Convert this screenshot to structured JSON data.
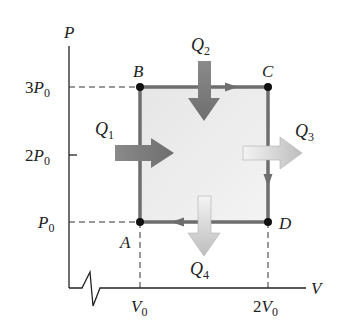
{
  "diagram": {
    "type": "PV-diagram",
    "axes": {
      "y_label": "P",
      "x_label": "V",
      "y_ticks": [
        {
          "coef": "3",
          "sym": "P",
          "sub": "0"
        },
        {
          "coef": "2",
          "sym": "P",
          "sub": "0"
        },
        {
          "coef": "",
          "sym": "P",
          "sub": "0"
        }
      ],
      "x_ticks": [
        {
          "coef": "",
          "sym": "V",
          "sub": "0"
        },
        {
          "coef": "2",
          "sym": "V",
          "sub": "0"
        }
      ]
    },
    "points": [
      {
        "name": "A",
        "V": "V0",
        "P": "P0"
      },
      {
        "name": "B",
        "V": "V0",
        "P": "3P0"
      },
      {
        "name": "C",
        "V": "2V0",
        "P": "3P0"
      },
      {
        "name": "D",
        "V": "2V0",
        "P": "P0"
      }
    ],
    "path": [
      "A",
      "B",
      "C",
      "D",
      "A"
    ],
    "heat_arrows": [
      {
        "label": "Q",
        "sub": "1",
        "direction": "in",
        "shade": "dark"
      },
      {
        "label": "Q",
        "sub": "2",
        "direction": "in",
        "shade": "dark"
      },
      {
        "label": "Q",
        "sub": "3",
        "direction": "out",
        "shade": "light"
      },
      {
        "label": "Q",
        "sub": "4",
        "direction": "out",
        "shade": "light"
      }
    ],
    "colors": {
      "path": "#6e6e6e",
      "fill": "#ededed",
      "arrow_in": "#7d7d7d",
      "arrow_out": "#c8c8c8"
    }
  }
}
